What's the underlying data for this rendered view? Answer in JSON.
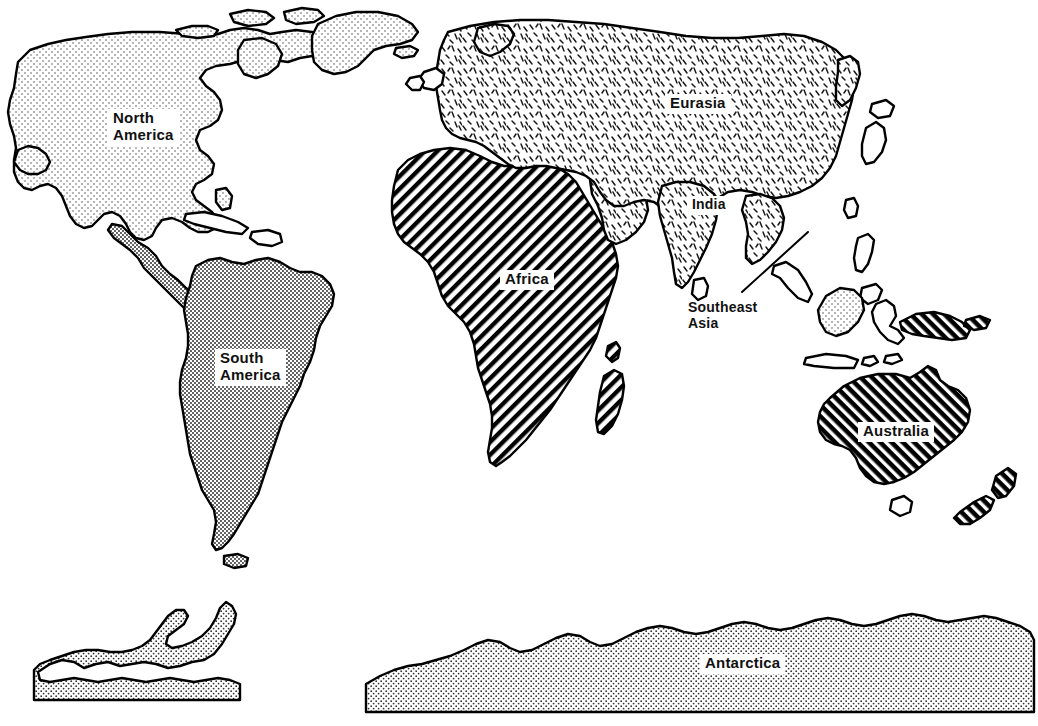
{
  "figure": {
    "type": "world-map",
    "background_color": "#ffffff",
    "outline_color": "#000000",
    "projection_note": "equirectangular world map, line art with pattern fills"
  },
  "labels": [
    {
      "id": "north-america",
      "text": "North\nAmerica",
      "x": 108,
      "y": 109,
      "font_size": 15,
      "boxed": true,
      "region_fill": "light-dots"
    },
    {
      "id": "south-america",
      "text": "South\nAmerica",
      "x": 215,
      "y": 349,
      "font_size": 15,
      "boxed": true,
      "region_fill": "dense-dots"
    },
    {
      "id": "africa",
      "text": "Africa",
      "x": 500,
      "y": 270,
      "font_size": 15,
      "boxed": true,
      "region_fill": "diagonal-hatch-up"
    },
    {
      "id": "eurasia",
      "text": "Eurasia",
      "x": 665,
      "y": 94,
      "font_size": 15,
      "boxed": true,
      "region_fill": "dash-stipple"
    },
    {
      "id": "india",
      "text": "India",
      "x": 687,
      "y": 196,
      "font_size": 14,
      "boxed": true,
      "region_fill": "dash-stipple"
    },
    {
      "id": "southeast-asia",
      "text": "Southeast\nAsia",
      "x": 688,
      "y": 300,
      "font_size": 14,
      "boxed": false,
      "region_fill": "none"
    },
    {
      "id": "australia",
      "text": "Australia",
      "x": 858,
      "y": 422,
      "font_size": 15,
      "boxed": true,
      "region_fill": "dense-hatch-down"
    },
    {
      "id": "antarctica",
      "text": "Antarctica",
      "x": 700,
      "y": 654,
      "font_size": 15,
      "boxed": true,
      "region_fill": "medium-dots"
    }
  ],
  "leader_lines": [
    {
      "id": "southeast-asia-leader",
      "from_x": 742,
      "from_y": 292,
      "to_x": 808,
      "to_y": 232
    }
  ],
  "patterns": {
    "light-dots": "sparse fine dot stipple",
    "dense-dots": "dense fine dot stipple",
    "medium-dots": "medium dot stipple",
    "dash-stipple": "scattered short dash marks",
    "diagonal-hatch-up": "45 degree hatch lines ascending left to right",
    "dense-hatch-down": "thick 45 degree hatch lines descending left to right"
  },
  "landmasses": [
    {
      "id": "north-america",
      "name": "North America",
      "fill": "light-dots"
    },
    {
      "id": "greenland",
      "name": "Greenland",
      "fill": "light-dots"
    },
    {
      "id": "canadian-arctic",
      "name": "Canadian Arctic Islands",
      "fill": "light-dots"
    },
    {
      "id": "central-america",
      "name": "Central America",
      "fill": "dense-dots"
    },
    {
      "id": "caribbean",
      "name": "Caribbean Islands",
      "fill": "none"
    },
    {
      "id": "south-america",
      "name": "South America",
      "fill": "dense-dots"
    },
    {
      "id": "africa",
      "name": "Africa",
      "fill": "diagonal-hatch-up"
    },
    {
      "id": "madagascar",
      "name": "Madagascar",
      "fill": "diagonal-hatch-up"
    },
    {
      "id": "eurasia",
      "name": "Eurasia",
      "fill": "dash-stipple"
    },
    {
      "id": "india",
      "name": "India",
      "fill": "dash-stipple"
    },
    {
      "id": "japan",
      "name": "Japan",
      "fill": "none"
    },
    {
      "id": "philippines",
      "name": "Philippines",
      "fill": "none"
    },
    {
      "id": "borneo",
      "name": "Borneo",
      "fill": "light-dots"
    },
    {
      "id": "sulawesi",
      "name": "Sulawesi",
      "fill": "none"
    },
    {
      "id": "sumatra-java",
      "name": "Sumatra and Java",
      "fill": "none"
    },
    {
      "id": "new-guinea",
      "name": "New Guinea",
      "fill": "dense-hatch-down"
    },
    {
      "id": "australia",
      "name": "Australia",
      "fill": "dense-hatch-down"
    },
    {
      "id": "tasmania",
      "name": "Tasmania",
      "fill": "none"
    },
    {
      "id": "new-zealand",
      "name": "New Zealand",
      "fill": "dense-hatch-down"
    },
    {
      "id": "antarctica-left",
      "name": "Antarctica West with Peninsula",
      "fill": "medium-dots"
    },
    {
      "id": "antarctica-right",
      "name": "Antarctica East",
      "fill": "medium-dots"
    }
  ]
}
